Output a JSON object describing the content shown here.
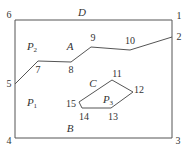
{
  "diagram": {
    "stroke_color": "#555555",
    "boundary": {
      "points": [
        [
          15,
          20
        ],
        [
          172,
          20
        ],
        [
          172,
          138
        ],
        [
          15,
          138
        ]
      ]
    },
    "polyline": {
      "points": [
        [
          15,
          84
        ],
        [
          38,
          61
        ],
        [
          71,
          62
        ],
        [
          91,
          47
        ],
        [
          130,
          50
        ],
        [
          172,
          37
        ]
      ]
    },
    "polygon": {
      "points": [
        [
          112,
          80
        ],
        [
          133,
          92
        ],
        [
          111,
          108
        ],
        [
          82,
          108
        ],
        [
          79,
          102
        ]
      ]
    },
    "vertex_labels": [
      {
        "id": "v1",
        "text": "1",
        "x": 179,
        "y": 16
      },
      {
        "id": "v2",
        "text": "2",
        "x": 179,
        "y": 37
      },
      {
        "id": "v3",
        "text": "3",
        "x": 178,
        "y": 141
      },
      {
        "id": "v4",
        "text": "4",
        "x": 9,
        "y": 141
      },
      {
        "id": "v5",
        "text": "5",
        "x": 9,
        "y": 84
      },
      {
        "id": "v6",
        "text": "6",
        "x": 9,
        "y": 15
      },
      {
        "id": "v7",
        "text": "7",
        "x": 38,
        "y": 70
      },
      {
        "id": "v8",
        "text": "8",
        "x": 71,
        "y": 70
      },
      {
        "id": "v9",
        "text": "9",
        "x": 93,
        "y": 38
      },
      {
        "id": "v10",
        "text": "10",
        "x": 130,
        "y": 41
      },
      {
        "id": "v11",
        "text": "11",
        "x": 117,
        "y": 74
      },
      {
        "id": "v12",
        "text": "12",
        "x": 139,
        "y": 90
      },
      {
        "id": "v13",
        "text": "13",
        "x": 113,
        "y": 117
      },
      {
        "id": "v14",
        "text": "14",
        "x": 84,
        "y": 117
      },
      {
        "id": "v15",
        "text": "15",
        "x": 71,
        "y": 104
      }
    ],
    "region_labels": [
      {
        "id": "D",
        "text": "D",
        "sub": "",
        "x": 82,
        "y": 12
      },
      {
        "id": "A",
        "text": "A",
        "sub": "",
        "x": 70,
        "y": 46
      },
      {
        "id": "P2",
        "text": "P",
        "sub": "2",
        "x": 32,
        "y": 47
      },
      {
        "id": "P1",
        "text": "P",
        "sub": "1",
        "x": 32,
        "y": 103
      },
      {
        "id": "C",
        "text": "C",
        "sub": "",
        "x": 93,
        "y": 83
      },
      {
        "id": "P3",
        "text": "P",
        "sub": "3",
        "x": 108,
        "y": 100
      },
      {
        "id": "B",
        "text": "B",
        "sub": "",
        "x": 70,
        "y": 128
      }
    ]
  }
}
